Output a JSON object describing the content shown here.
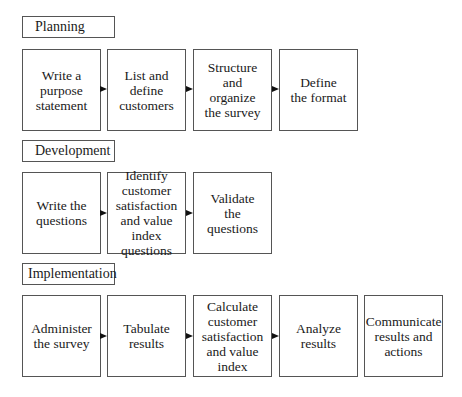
{
  "sections": [
    {
      "label": "Planning",
      "steps": [
        "Write a\npurpose\nstatement",
        "List and\ndefine\ncustomers",
        "Structure\nand\norganize\nthe survey",
        "Define\nthe format"
      ]
    },
    {
      "label": "Development",
      "steps": [
        "Write the\nquestions",
        "Identify\ncustomer\nsatisfaction\nand value index\nquestions",
        "Validate\nthe\nquestions"
      ]
    },
    {
      "label": "Implementation",
      "steps": [
        "Administer\nthe survey",
        "Tabulate\nresults",
        "Calculate\ncustomer\nsatisfaction\nand value\nindex",
        "Analyze\nresults",
        "Communicate\nresults and\nactions"
      ]
    }
  ],
  "colors": {
    "border": "#555555",
    "text": "#1a1a1a",
    "background": "#ffffff"
  },
  "icons": {
    "arrow": "arrow-right-icon"
  }
}
